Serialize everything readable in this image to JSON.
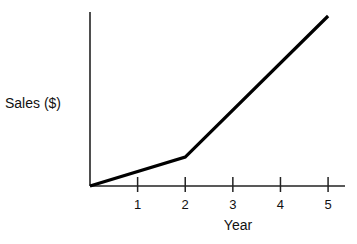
{
  "chart_data": {
    "type": "line",
    "title": "",
    "xlabel": "Year",
    "ylabel": "Sales ($)",
    "x_ticks": [
      "1",
      "2",
      "3",
      "4",
      "5"
    ],
    "x": [
      0,
      2,
      5
    ],
    "series": [
      {
        "name": "Sales",
        "values": [
          0,
          0.17,
          1.0
        ]
      }
    ],
    "xlim": [
      0,
      5.2
    ],
    "ylim": [
      0,
      1.0
    ],
    "y_tick_labels": [],
    "grid": false,
    "legend": "none"
  },
  "colors": {
    "line": "#000000",
    "axis": "#222222",
    "background": "#ffffff"
  },
  "layout": {
    "origin_px": [
      90,
      186
    ],
    "x_unit_px": 48,
    "y_top_px": 12,
    "x_end_px": 345
  }
}
